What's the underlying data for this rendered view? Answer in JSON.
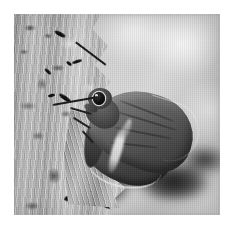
{
  "image": {
    "kind": "photograph",
    "subject": "butterfly-on-tree-bark",
    "description": "Grayscale macro photograph of a skipper butterfly resting head-up on the side of a rough tree trunk",
    "color_mode": "grayscale",
    "border_color": "#ffffff",
    "frame": {
      "left": 14,
      "top": 14,
      "width": 206,
      "height": 201
    },
    "subjects": [
      {
        "name": "butterfly",
        "detail": "skipper, wings closed, facing left, dark brown-gray with pale diagonal band"
      },
      {
        "name": "tree-bark",
        "detail": "rough mottled vertical trunk occupying the left third"
      },
      {
        "name": "background",
        "detail": "blurred light gray bokeh with a dark shadow mass at lower right"
      }
    ],
    "parts": {
      "head": "head-with-large-dark-compound-eye",
      "eye": "compound-eye",
      "antenna_upper": "upper-antenna-with-club-tip",
      "antenna_lower": "lower-antenna-with-club-tip",
      "forewing": "forewing",
      "hindwing": "hindwing",
      "wing_band": "pale-diagonal-wing-band",
      "thorax": "thorax",
      "abdomen": "abdomen",
      "legs": "legs-gripping-bark"
    },
    "tones": {
      "background_light": "#d8d8d8",
      "background_highlight": "#f2f2f2",
      "bark_mid": "#b2b2b2",
      "bark_dark": "#121212",
      "wing_mid": "#5f5a55",
      "wing_dark": "#3a3633",
      "wing_band": "#efece7",
      "eye_dark": "#060606",
      "shadow": "#101010"
    }
  }
}
